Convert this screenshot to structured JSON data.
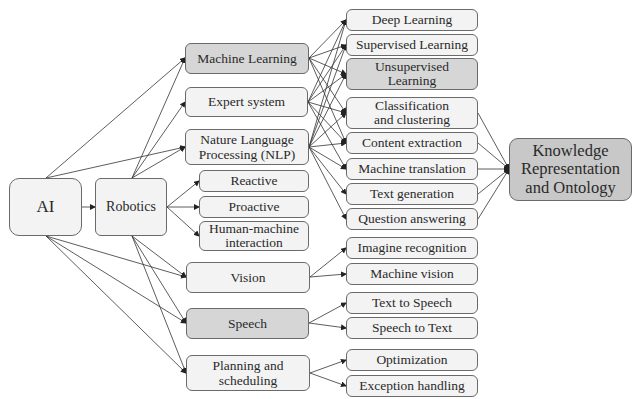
{
  "diagram": {
    "root": {
      "id": "ai",
      "label": "AI"
    },
    "hub": {
      "id": "robotics",
      "label": "Robotics"
    },
    "middle": [
      {
        "id": "ml",
        "label": "Machine Learning",
        "shade": "dark"
      },
      {
        "id": "es",
        "label": "Expert system",
        "shade": "light"
      },
      {
        "id": "nlp",
        "label": "Nature Language Processing (NLP)",
        "shade": "light"
      },
      {
        "id": "reactive",
        "label": "Reactive",
        "shade": "light"
      },
      {
        "id": "proactive",
        "label": "Proactive",
        "shade": "light"
      },
      {
        "id": "hmi",
        "label": "Human-machine interaction",
        "shade": "light"
      },
      {
        "id": "vision",
        "label": "Vision",
        "shade": "light"
      },
      {
        "id": "speech",
        "label": "Speech",
        "shade": "dark"
      },
      {
        "id": "planning",
        "label": "Planning and scheduling",
        "shade": "light"
      }
    ],
    "right": [
      {
        "id": "dl",
        "label": "Deep Learning",
        "shade": "light"
      },
      {
        "id": "sl",
        "label": "Supervised Learning",
        "shade": "light"
      },
      {
        "id": "ul",
        "label": "Unsupervised Learning",
        "shade": "dark"
      },
      {
        "id": "cc",
        "label": "Classification and clustering",
        "shade": "light"
      },
      {
        "id": "ce",
        "label": "Content extraction",
        "shade": "light"
      },
      {
        "id": "mt",
        "label": "Machine translation",
        "shade": "light"
      },
      {
        "id": "tg",
        "label": "Text generation",
        "shade": "light"
      },
      {
        "id": "qa",
        "label": "Question answering",
        "shade": "light"
      },
      {
        "id": "ir",
        "label": "Imagine recognition",
        "shade": "light"
      },
      {
        "id": "mv",
        "label": "Machine vision",
        "shade": "light"
      },
      {
        "id": "tts",
        "label": "Text to Speech",
        "shade": "light"
      },
      {
        "id": "stt",
        "label": "Speech to Text",
        "shade": "light"
      },
      {
        "id": "opt",
        "label": "Optimization",
        "shade": "light"
      },
      {
        "id": "eh",
        "label": "Exception handling",
        "shade": "light"
      }
    ],
    "sink": {
      "id": "kro",
      "label": "Knowledge Representation and Ontology"
    },
    "labels": {
      "ai": "AI",
      "robotics": "Robotics",
      "ml": "Machine Learning",
      "es": "Expert system",
      "nlp_1": "Nature Language",
      "nlp_2": "Processing (NLP)",
      "reactive": "Reactive",
      "proactive": "Proactive",
      "hmi_1": "Human-machine",
      "hmi_2": "interaction",
      "vision": "Vision",
      "speech": "Speech",
      "planning_1": "Planning and",
      "planning_2": "scheduling",
      "dl": "Deep Learning",
      "sl": "Supervised Learning",
      "ul_1": "Unsupervised",
      "ul_2": "Learning",
      "cc_1": "Classification",
      "cc_2": "and clustering",
      "ce": "Content extraction",
      "mt": "Machine translation",
      "tg": "Text generation",
      "qa": "Question answering",
      "ir": "Imagine recognition",
      "mv": "Machine vision",
      "tts": "Text to Speech",
      "stt": "Speech to Text",
      "opt": "Optimization",
      "eh": "Exception handling",
      "kro_1": "Knowledge",
      "kro_2": "Representation",
      "kro_3": "and Ontology"
    },
    "edges": [
      [
        "ai",
        "robotics"
      ],
      [
        "ai",
        "ml"
      ],
      [
        "ai",
        "nlp"
      ],
      [
        "ai",
        "vision"
      ],
      [
        "ai",
        "speech"
      ],
      [
        "ai",
        "planning"
      ],
      [
        "robotics",
        "ml"
      ],
      [
        "robotics",
        "es"
      ],
      [
        "robotics",
        "nlp"
      ],
      [
        "robotics",
        "reactive"
      ],
      [
        "robotics",
        "proactive"
      ],
      [
        "robotics",
        "hmi"
      ],
      [
        "robotics",
        "vision"
      ],
      [
        "robotics",
        "speech"
      ],
      [
        "robotics",
        "planning"
      ],
      [
        "ml",
        "dl"
      ],
      [
        "ml",
        "sl"
      ],
      [
        "ml",
        "ul"
      ],
      [
        "ml",
        "cc"
      ],
      [
        "ml",
        "ce"
      ],
      [
        "es",
        "dl"
      ],
      [
        "es",
        "sl"
      ],
      [
        "es",
        "ul"
      ],
      [
        "es",
        "cc"
      ],
      [
        "es",
        "ce"
      ],
      [
        "es",
        "mt"
      ],
      [
        "nlp",
        "dl"
      ],
      [
        "nlp",
        "sl"
      ],
      [
        "nlp",
        "ul"
      ],
      [
        "nlp",
        "cc"
      ],
      [
        "nlp",
        "ce"
      ],
      [
        "nlp",
        "mt"
      ],
      [
        "nlp",
        "tg"
      ],
      [
        "nlp",
        "qa"
      ],
      [
        "vision",
        "ir"
      ],
      [
        "vision",
        "mv"
      ],
      [
        "speech",
        "tts"
      ],
      [
        "speech",
        "stt"
      ],
      [
        "planning",
        "opt"
      ],
      [
        "planning",
        "eh"
      ],
      [
        "cc",
        "kro"
      ],
      [
        "ce",
        "kro"
      ],
      [
        "mt",
        "kro"
      ],
      [
        "tg",
        "kro"
      ],
      [
        "qa",
        "kro"
      ]
    ],
    "colors": {
      "light_fill": "#f3f3f3",
      "dark_fill": "#d6d6d6",
      "sink_fill": "#c8c8c8",
      "stroke": "#6a6a6a",
      "edge": "#333333"
    }
  }
}
